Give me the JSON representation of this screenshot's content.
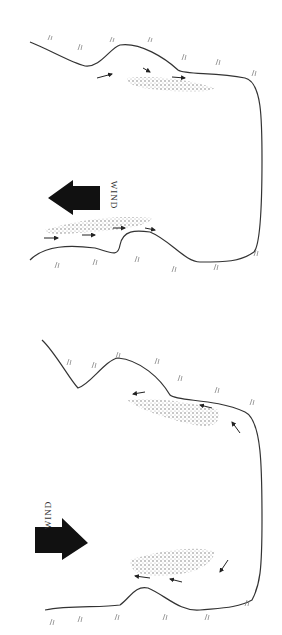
{
  "diagram": {
    "panels": [
      {
        "id": "top",
        "wind_label": "WIND",
        "wind_direction": "up (left on rotated figure)",
        "colors": {
          "arrow": "#111111",
          "shore": "#333333",
          "bar_stipple": "#777777"
        }
      },
      {
        "id": "bottom",
        "wind_label": "WIND",
        "wind_direction": "down (right on rotated figure)",
        "colors": {
          "arrow": "#111111",
          "shore": "#333333",
          "bar_stipple": "#777777"
        }
      }
    ]
  }
}
